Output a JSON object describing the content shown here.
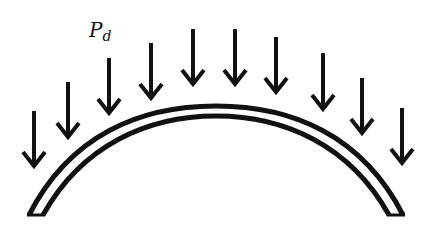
{
  "diagram": {
    "load_label": {
      "main": "P",
      "subscript": "d"
    },
    "colors": {
      "stroke": "#111111",
      "background": "#ffffff"
    },
    "arrows": [
      {
        "x": 34,
        "y1": 111,
        "y2": 166
      },
      {
        "x": 68,
        "y1": 82,
        "y2": 137
      },
      {
        "x": 109,
        "y1": 58,
        "y2": 113
      },
      {
        "x": 151,
        "y1": 43,
        "y2": 98
      },
      {
        "x": 193,
        "y1": 29,
        "y2": 84
      },
      {
        "x": 235,
        "y1": 29,
        "y2": 84
      },
      {
        "x": 276,
        "y1": 37,
        "y2": 92
      },
      {
        "x": 323,
        "y1": 53,
        "y2": 109
      },
      {
        "x": 362,
        "y1": 78,
        "y2": 133
      },
      {
        "x": 402,
        "y1": 108,
        "y2": 163
      }
    ]
  }
}
